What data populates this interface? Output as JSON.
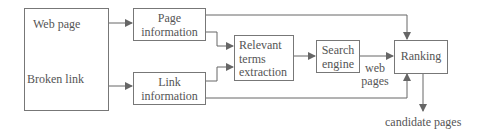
{
  "diagram": {
    "nodes": {
      "source": {
        "line1": "Web page",
        "line2": "Broken link"
      },
      "page_info": {
        "line1": "Page",
        "line2": "information"
      },
      "link_info": {
        "line1": "Link",
        "line2": "information"
      },
      "relevant_terms": {
        "line1": "Relevant",
        "line2": "terms",
        "line3": "extraction"
      },
      "search_engine": {
        "line1": "Search",
        "line2": "engine"
      },
      "ranking": {
        "label": "Ranking"
      }
    },
    "edge_labels": {
      "web_pages_1": "web",
      "web_pages_2": "pages",
      "output": "candidate pages"
    },
    "colors": {
      "line": "#666666",
      "text": "#555555"
    }
  }
}
